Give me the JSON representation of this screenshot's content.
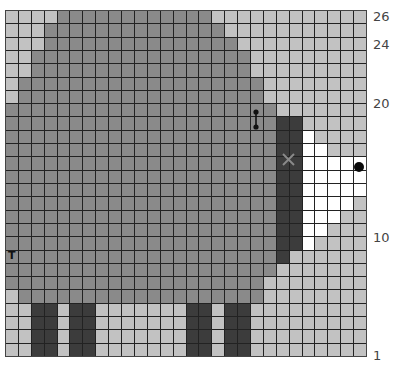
{
  "chart_title": "Knitting colorwork chart (sheep motif)",
  "grid": {
    "columns": 28,
    "rows": 26,
    "row_order": "top row is row 26, bottom row is row 1",
    "colors": {
      "L": "#c2c2c2",
      "M": "#8a8a8a",
      "D": "#3c3c3c",
      "W": "#ffffff"
    },
    "color_meaning": {
      "L": "background (light gray)",
      "M": "body (medium gray)",
      "D": "head / legs (dark gray)",
      "W": "face (white)"
    },
    "cells": [
      "LLLLMMMMMMMMMMMMLLLLLLLLLLLL",
      "LLLMMMMMMMMMMMMMMLLLLLLLLLLL",
      "LLLMMMMMMMMMMMMMMMLLLLLLLLLL",
      "LLMMMMMMMMMMMMMMMMMLLLLLLLLL",
      "LLMMMMMMMMMMMMMMMMMLLLLLLLLL",
      "LMMMMMMMMMMMMMMMMMMMLLLLLLLL",
      "LMMMMMMMMMMMMMMMMMMMLLLLLLLL",
      "MMMMMMMMMMMMMMMMMMMMMLLLLLLL",
      "MMMMMMMMMMMMMMMMMMMMMDDLLLLL",
      "MMMMMMMMMMMMMMMMMMMMMDDWLLLL",
      "MMMMMMMMMMMMMMMMMMMMMDDWWLLL",
      "MMMMMMMMMMMMMMMMMMMMMDDWWWWW",
      "MMMMMMMMMMMMMMMMMMMMMDDWWWWW",
      "MMMMMMMMMMMMMMMMMMMMMDDWWWWW",
      "MMMMMMMMMMMMMMMMMMMMMDDWWWWL",
      "MMMMMMMMMMMMMMMMMMMMMDDWWWLL",
      "MMMMMMMMMMMMMMMMMMMMMDDWWLLL",
      "MMMMMMMMMMMMMMMMMMMMMDDWLLLL",
      "MMMMMMMMMMMMMMMMMMMMMDLLLLLL",
      "MMMMMMMMMMMMMMMMMMMMMLLLLLLL",
      "MMMMMMMMMMMMMMMMMMMMLLLLLLLL",
      "LMMMMMMMMMMMMMMMMMMMLLLLLLLL",
      "LLDDLDDLLLLLLLDDLDDLLLLLLLLL",
      "LLDDLDDLLLLLLLDDLDDLLLLLLLLL",
      "LLDDLDDLLLLLLLDDLDDLLLLLLLLL",
      "LLDDLDDLLLLLLLDDLDDLLLLLLLLL"
    ]
  },
  "row_labels": [
    {
      "text": "26",
      "y": 10
    },
    {
      "text": "24",
      "y": 38
    },
    {
      "text": "20",
      "y": 97
    },
    {
      "text": "10",
      "y": 231
    },
    {
      "text": "1",
      "y": 349
    }
  ],
  "symbols": {
    "t_marker": {
      "text": "T",
      "col": 1,
      "row": 8
    },
    "bead_marker": {
      "name": "eye-bar",
      "col": 20,
      "rows": [
        19,
        18
      ]
    },
    "x_marker": {
      "text": "×",
      "between_cols": [
        22,
        23
      ],
      "between_rows": [
        16,
        15
      ]
    },
    "dot_marker": {
      "name": "eye-dot",
      "col": 28,
      "row": 15
    }
  }
}
